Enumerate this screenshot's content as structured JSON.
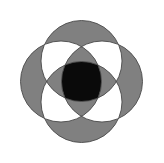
{
  "figure": {
    "title": "Four overlapping circles rosette",
    "description": "Four equal circles arranged around a common center; regions shaded gray, white, and black according to overlap depth.",
    "canvas": {
      "width": 164,
      "height": 163,
      "background": "#ffffff"
    },
    "colors": {
      "background": "#ffffff",
      "shade_gray": "#808080",
      "shade_white": "#ffffff",
      "shade_black": "#0a0a0a",
      "outline": "#4a4a4a"
    },
    "geometry": {
      "center_x": 81.5,
      "center_y": 81.5,
      "radius": 40.5,
      "offset": 20.5,
      "stroke_width": 0.9
    },
    "circles": [
      {
        "name": "top-circle",
        "cx": 81.5,
        "cy": 61.0,
        "r": 40.5
      },
      {
        "name": "right-circle",
        "cx": 102.0,
        "cy": 81.5,
        "r": 40.5
      },
      {
        "name": "bottom-circle",
        "cx": 81.5,
        "cy": 102.0,
        "r": 40.5
      },
      {
        "name": "left-circle",
        "cx": 61.0,
        "cy": 81.5,
        "r": 40.5
      }
    ],
    "center_shape": {
      "name": "center-squircle",
      "fill": "#0a0a0a",
      "bounds": {
        "x": 57,
        "y": 57,
        "width": 49,
        "height": 49
      }
    },
    "legend": {
      "odd_overlap_label": "gray",
      "even_overlap_label": "white",
      "full_overlap_label": "black"
    }
  }
}
